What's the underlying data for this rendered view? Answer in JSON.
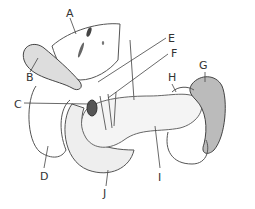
{
  "figure": {
    "labels": [
      {
        "id": "A",
        "text": "A",
        "x": 66,
        "y": 8
      },
      {
        "id": "B",
        "text": "B",
        "x": 26,
        "y": 72
      },
      {
        "id": "C",
        "text": "C",
        "x": 14,
        "y": 99
      },
      {
        "id": "D",
        "text": "D",
        "x": 40,
        "y": 171
      },
      {
        "id": "E",
        "text": "E",
        "x": 168,
        "y": 33
      },
      {
        "id": "F",
        "text": "F",
        "x": 171,
        "y": 48
      },
      {
        "id": "G",
        "text": "G",
        "x": 199,
        "y": 60
      },
      {
        "id": "H",
        "text": "H",
        "x": 168,
        "y": 72
      },
      {
        "id": "I",
        "text": "I",
        "x": 158,
        "y": 172
      },
      {
        "id": "J",
        "text": "J",
        "x": 103,
        "y": 188
      }
    ]
  }
}
